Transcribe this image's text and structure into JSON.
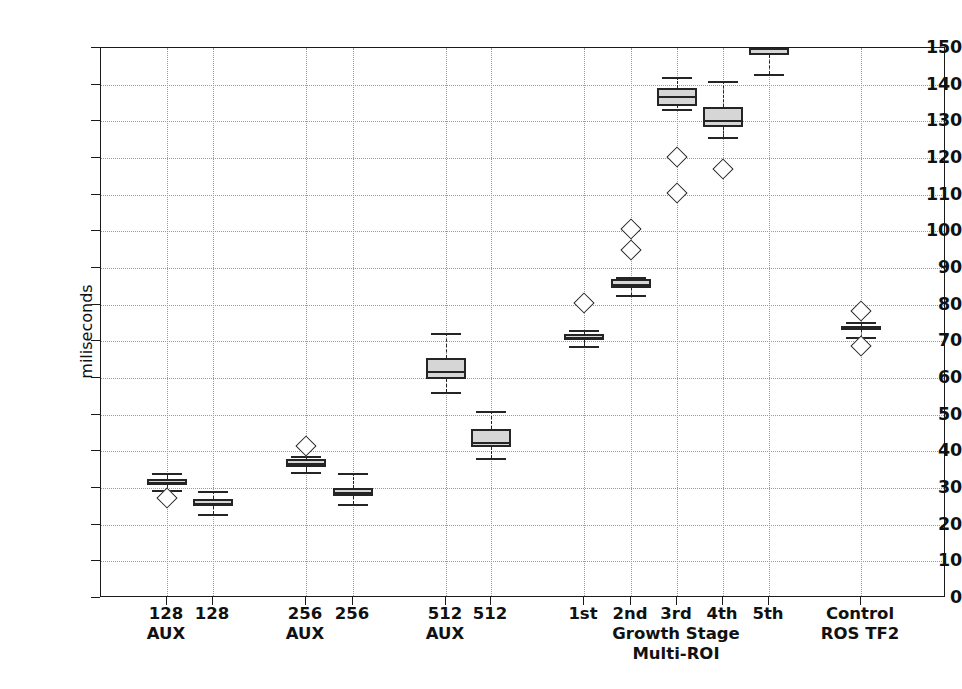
{
  "chart_data": {
    "type": "box",
    "title": "",
    "xlabel": "",
    "ylabel": "miliseconds",
    "ylim": [
      0,
      150
    ],
    "yticks": [
      0,
      10,
      20,
      30,
      40,
      50,
      60,
      70,
      80,
      90,
      100,
      110,
      120,
      130,
      140,
      150
    ],
    "grid": true,
    "legend": "none",
    "annotations": [
      {
        "text": "Growth Stage",
        "x_category_center": "3rd",
        "line": 1
      },
      {
        "text": "Multi-ROI",
        "x_category_center": "3rd",
        "line": 2
      }
    ],
    "categories": [
      "128\nAUX",
      "128",
      "256\nAUX",
      "256",
      "512\nAUX",
      "512",
      "1st",
      "2nd",
      "3rd",
      "4th",
      "5th",
      "Control\nROS TF2"
    ],
    "boxes": [
      {
        "label": "128 AUX",
        "label_line1": "128",
        "label_line2": "AUX",
        "x_px": 166,
        "whisker_low": 29.5,
        "q1": 30.8,
        "median": 31.6,
        "q3": 32.4,
        "whisker_high": 34.0,
        "fliers": [
          27.3
        ]
      },
      {
        "label": "128",
        "label_line1": "128",
        "label_line2": "",
        "x_px": 212,
        "whisker_low": 22.8,
        "q1": 25.0,
        "median": 26.0,
        "q3": 27.0,
        "whisker_high": 29.2,
        "fliers": []
      },
      {
        "label": "256 AUX",
        "label_line1": "256",
        "label_line2": "AUX",
        "x_px": 305,
        "whisker_low": 34.4,
        "q1": 35.8,
        "median": 36.7,
        "q3": 37.8,
        "whisker_high": 38.6,
        "fliers": [
          41.5
        ]
      },
      {
        "label": "256",
        "label_line1": "256",
        "label_line2": "",
        "x_px": 352,
        "whisker_low": 25.7,
        "q1": 27.8,
        "median": 28.8,
        "q3": 30.0,
        "whisker_high": 34.0,
        "fliers": []
      },
      {
        "label": "512 AUX",
        "label_line1": "512",
        "label_line2": "AUX",
        "x_px": 445,
        "whisker_low": 56.1,
        "q1": 59.8,
        "median": 62.0,
        "q3": 65.4,
        "whisker_high": 72.4,
        "fliers": []
      },
      {
        "label": "512",
        "label_line1": "512",
        "label_line2": "",
        "x_px": 490,
        "whisker_low": 38.2,
        "q1": 41.2,
        "median": 42.6,
        "q3": 46.0,
        "whisker_high": 51.0,
        "fliers": []
      },
      {
        "label": "1st",
        "label_line1": "1st",
        "label_line2": "",
        "x_px": 583,
        "whisker_low": 68.8,
        "q1": 70.5,
        "median": 71.2,
        "q3": 72.0,
        "whisker_high": 73.0,
        "fliers": [
          80.4
        ]
      },
      {
        "label": "2nd",
        "label_line1": "2nd",
        "label_line2": "",
        "x_px": 630,
        "whisker_low": 82.6,
        "q1": 84.6,
        "median": 85.6,
        "q3": 86.9,
        "whisker_high": 87.5,
        "fliers": [
          95.0,
          100.7
        ]
      },
      {
        "label": "3rd",
        "label_line1": "3rd",
        "label_line2": "",
        "x_px": 676,
        "whisker_low": 133.5,
        "q1": 134.2,
        "median": 137.0,
        "q3": 139.2,
        "whisker_high": 142.2,
        "fliers": [
          120.4,
          110.5
        ]
      },
      {
        "label": "4th",
        "label_line1": "4th",
        "label_line2": "",
        "x_px": 722,
        "whisker_low": 125.6,
        "q1": 128.5,
        "median": 130.4,
        "q3": 133.8,
        "whisker_high": 141.0,
        "fliers": [
          116.9
        ]
      },
      {
        "label": "5th",
        "label_line1": "5th",
        "label_line2": "",
        "x_px": 768,
        "whisker_low": 143.0,
        "q1": 148.0,
        "median": 150.0,
        "q3": 152.0,
        "whisker_high": 155.0,
        "fliers": [],
        "clipped_top": true
      },
      {
        "label": "Control ROS TF2",
        "label_line1": "Control",
        "label_line2": "ROS TF2",
        "x_px": 860,
        "whisker_low": 71.2,
        "q1": 73.0,
        "median": 73.6,
        "q3": 74.3,
        "whisker_high": 75.4,
        "fliers": [
          78.2,
          68.6
        ]
      }
    ],
    "style": {
      "box_fill": "#d6d6d6",
      "box_edge": "#242424",
      "grid_color": "#9a9a9a",
      "axis_color": "#1a1a1a",
      "background": "#ffffff"
    }
  }
}
